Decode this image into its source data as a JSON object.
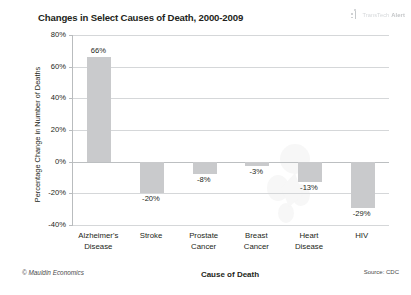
{
  "brand": {
    "mark_icon": "logo-mark-icon",
    "text_light": "TransTech",
    "text_bold": "Alert"
  },
  "footer": {
    "copyright": "© Mauldin Economics",
    "source": "Source: CDC"
  },
  "colors": {
    "bar": "#c9cacc",
    "gridline": "#d5d7d9",
    "axis": "#b9bcbe",
    "text": "#231f20"
  },
  "chart_data": {
    "type": "bar",
    "title": "Changes in Select Causes of Death, 2000-2009",
    "xlabel": "Cause of Death",
    "ylabel": "Percentage Change in Number of Deaths",
    "categories": [
      "Alzheimer's\nDisease",
      "Stroke",
      "Prostate\nCancer",
      "Breast\nCancer",
      "Heart\nDisease",
      "HIV"
    ],
    "category_lines": [
      [
        "Alzheimer's",
        "Disease"
      ],
      [
        "Stroke",
        ""
      ],
      [
        "Prostate",
        "Cancer"
      ],
      [
        "Breast",
        "Cancer"
      ],
      [
        "Heart",
        "Disease"
      ],
      [
        "HIV",
        ""
      ]
    ],
    "values": [
      66,
      -20,
      -8,
      -3,
      -13,
      -29
    ],
    "value_labels": [
      "66%",
      "-20%",
      "-8%",
      "-3%",
      "-13%",
      "-29%"
    ],
    "ylim": [
      -40,
      80
    ],
    "yticks": [
      80,
      60,
      40,
      20,
      0,
      -20,
      -40
    ],
    "ytick_labels": [
      "80%",
      "60%",
      "40%",
      "20%",
      "0%",
      "-20%",
      "-40%"
    ],
    "grid": true,
    "legend": "none",
    "series_color": "#c9cacc"
  }
}
